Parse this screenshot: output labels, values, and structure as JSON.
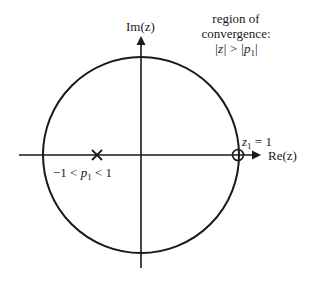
{
  "diagram": {
    "type": "pole-zero plot (z-plane)",
    "axes": {
      "vertical_label": "Im(z)",
      "horizontal_label": "Re(z)"
    },
    "unit_circle": {
      "center_px": [
        141,
        155
      ],
      "radius_px": 98
    },
    "region_of_convergence": {
      "line1": "region of",
      "line2": "convergence:",
      "condition_lhs": "|z|",
      "condition_op": " > ",
      "condition_rhs_open": "|p",
      "condition_rhs_sub": "1",
      "condition_rhs_close": "|"
    },
    "zero": {
      "marker": "o",
      "name": "z",
      "subscript": "1",
      "equals": " = 1",
      "position_px": [
        238,
        155
      ]
    },
    "pole": {
      "marker": "x",
      "prefix": "−1 < ",
      "name": "p",
      "subscript": "1",
      "suffix": " < 1",
      "position_px": [
        97,
        155
      ]
    }
  },
  "colors": {
    "stroke": "#1a1a1a",
    "background": "#ffffff"
  }
}
